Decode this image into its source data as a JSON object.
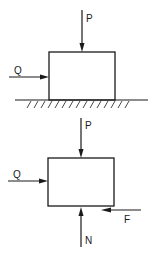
{
  "figure": {
    "type": "free-body-diagram",
    "colors": {
      "ink": "#1a1a1a",
      "background": "#ffffff"
    },
    "top_panel": {
      "name": "block-on-surface",
      "forces": [
        {
          "label": "P",
          "direction": "down",
          "description": "vertical load on top of block"
        },
        {
          "label": "Q",
          "direction": "right",
          "description": "horizontal push on left face"
        }
      ],
      "support": "hatched ground surface"
    },
    "bottom_panel": {
      "name": "free-body-of-block",
      "forces": [
        {
          "label": "P",
          "direction": "down",
          "description": "vertical load on top of block"
        },
        {
          "label": "Q",
          "direction": "right",
          "description": "horizontal push on left face"
        },
        {
          "label": "F",
          "direction": "left",
          "description": "friction force at bottom surface"
        },
        {
          "label": "N",
          "direction": "up",
          "description": "normal reaction at bottom surface"
        }
      ]
    },
    "labels": {
      "top_p": "P",
      "top_q": "Q",
      "bot_p": "P",
      "bot_q": "Q",
      "bot_f": "F",
      "bot_n": "N"
    },
    "caption_fragment": ""
  }
}
